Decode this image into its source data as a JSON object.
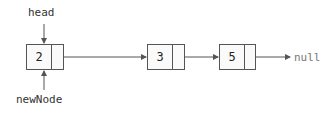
{
  "labels": {
    "head": "head",
    "new_node": "newNode",
    "null": "null"
  },
  "nodes": [
    {
      "value": "2"
    },
    {
      "value": "3"
    },
    {
      "value": "5"
    }
  ],
  "colors": {
    "stroke": "#555555",
    "text": "#333333",
    "null_text": "#777777"
  }
}
